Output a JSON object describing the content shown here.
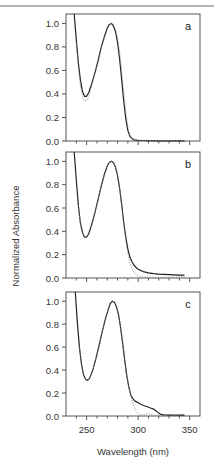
{
  "chart_data": {
    "type": "line",
    "layout": "3 vertically stacked panels sharing x-axis",
    "xlabel": "Wavelength (nm)",
    "ylabel": "Normalized Absorbance",
    "xlim": [
      230,
      360
    ],
    "ylim": [
      0.0,
      1.08
    ],
    "x_ticks": [
      250,
      300,
      350
    ],
    "x_minor_step": 10,
    "y_ticks": [
      0.0,
      0.2,
      0.4,
      0.6,
      0.8,
      1.0
    ],
    "y_tick_labels": [
      "0.0",
      "0.2",
      "0.4",
      "0.6",
      "0.8",
      "1.0"
    ],
    "grid": false,
    "legend": null,
    "panels": [
      {
        "label": "a",
        "series": [
          {
            "name": "solid",
            "style": "solid",
            "x": [
              238,
              240,
              242,
              244,
              246,
              248,
              250,
              252,
              255,
              258,
              261,
              264,
              267,
              270,
              272,
              274,
              276,
              278,
              280,
              282,
              284,
              286,
              288,
              290,
              292,
              294,
              296,
              298,
              300,
              305,
              310,
              320,
              330,
              340,
              345
            ],
            "y": [
              1.08,
              0.86,
              0.66,
              0.52,
              0.42,
              0.38,
              0.38,
              0.41,
              0.49,
              0.58,
              0.68,
              0.79,
              0.88,
              0.96,
              0.99,
              1.0,
              0.98,
              0.93,
              0.84,
              0.7,
              0.52,
              0.34,
              0.19,
              0.09,
              0.04,
              0.02,
              0.01,
              0.008,
              0.005,
              0.004,
              0.003,
              0.002,
              0.002,
              0.002,
              0.002
            ]
          },
          {
            "name": "dotted",
            "style": "dotted",
            "x": [
              240,
              242,
              244,
              246,
              248,
              250,
              252,
              255,
              258,
              261,
              264,
              267,
              270,
              272,
              274,
              276,
              278,
              280,
              282,
              284,
              286,
              288,
              290,
              292,
              294,
              296,
              298,
              300,
              305,
              310,
              320,
              330,
              340,
              345
            ],
            "y": [
              0.84,
              0.62,
              0.47,
              0.38,
              0.34,
              0.34,
              0.38,
              0.47,
              0.57,
              0.67,
              0.78,
              0.87,
              0.95,
              0.99,
              1.0,
              0.99,
              0.95,
              0.88,
              0.76,
              0.6,
              0.42,
              0.25,
              0.12,
              0.05,
              0.02,
              0.01,
              0.008,
              0.006,
              0.005,
              0.004,
              0.004,
              0.004,
              0.004,
              0.004
            ]
          }
        ]
      },
      {
        "label": "b",
        "series": [
          {
            "name": "solid",
            "style": "solid",
            "x": [
              238,
              240,
              242,
              244,
              246,
              248,
              250,
              252,
              255,
              258,
              261,
              264,
              267,
              270,
              272,
              274,
              276,
              278,
              280,
              282,
              284,
              286,
              288,
              290,
              292,
              294,
              296,
              298,
              300,
              305,
              310,
              315,
              320,
              330,
              340,
              345
            ],
            "y": [
              1.08,
              0.84,
              0.62,
              0.47,
              0.39,
              0.35,
              0.35,
              0.38,
              0.46,
              0.56,
              0.67,
              0.78,
              0.88,
              0.96,
              0.99,
              1.0,
              0.99,
              0.95,
              0.88,
              0.77,
              0.63,
              0.48,
              0.35,
              0.25,
              0.18,
              0.14,
              0.11,
              0.09,
              0.075,
              0.055,
              0.045,
              0.038,
              0.033,
              0.028,
              0.025,
              0.024
            ]
          },
          {
            "name": "dotted",
            "style": "dotted",
            "x": [
              242,
              244,
              246,
              248,
              250,
              252,
              255,
              258,
              261,
              264,
              267,
              270,
              272,
              274,
              276,
              278,
              280,
              282,
              284,
              286,
              288,
              290,
              292,
              294,
              296,
              298,
              300,
              302,
              305,
              310,
              320,
              330,
              340,
              345
            ],
            "y": [
              0.62,
              0.47,
              0.39,
              0.35,
              0.35,
              0.38,
              0.46,
              0.56,
              0.67,
              0.78,
              0.88,
              0.96,
              0.99,
              1.0,
              0.99,
              0.95,
              0.88,
              0.77,
              0.62,
              0.46,
              0.32,
              0.21,
              0.13,
              0.08,
              0.05,
              0.03,
              0.02,
              0.012,
              0.008,
              0.006,
              0.005,
              0.006,
              0.01,
              0.012
            ]
          }
        ]
      },
      {
        "label": "c",
        "series": [
          {
            "name": "solid",
            "style": "solid",
            "x": [
              239,
              241,
              243,
              245,
              247,
              249,
              251,
              253,
              256,
              259,
              262,
              265,
              268,
              271,
              273,
              275,
              277,
              279,
              281,
              283,
              285,
              287,
              289,
              291,
              293,
              295,
              297,
              300,
              303,
              306,
              309,
              312,
              315,
              318,
              320,
              322,
              325,
              330,
              335,
              340,
              345
            ],
            "y": [
              1.08,
              0.82,
              0.6,
              0.45,
              0.36,
              0.32,
              0.31,
              0.33,
              0.4,
              0.5,
              0.61,
              0.73,
              0.84,
              0.93,
              0.98,
              1.0,
              0.99,
              0.95,
              0.88,
              0.77,
              0.63,
              0.48,
              0.35,
              0.25,
              0.18,
              0.15,
              0.13,
              0.115,
              0.1,
              0.09,
              0.08,
              0.07,
              0.06,
              0.04,
              0.025,
              0.015,
              0.01,
              0.008,
              0.007,
              0.007,
              0.008
            ]
          },
          {
            "name": "dotted",
            "style": "dotted",
            "x": [
              243,
              245,
              247,
              249,
              251,
              253,
              256,
              259,
              262,
              265,
              268,
              271,
              273,
              275,
              277,
              279,
              281,
              283,
              285,
              287,
              289,
              291,
              293,
              295,
              297,
              299,
              301,
              305,
              310,
              315,
              320,
              325,
              330,
              335,
              340,
              345
            ],
            "y": [
              0.6,
              0.45,
              0.36,
              0.32,
              0.31,
              0.33,
              0.4,
              0.5,
              0.61,
              0.73,
              0.84,
              0.93,
              0.98,
              1.0,
              0.99,
              0.95,
              0.88,
              0.77,
              0.63,
              0.48,
              0.35,
              0.25,
              0.17,
              0.11,
              0.06,
              0.03,
              0.015,
              0.01,
              0.02,
              0.005,
              0.01,
              0.005,
              0.012,
              0.006,
              0.01,
              0.02
            ]
          }
        ]
      }
    ]
  },
  "layout_px": {
    "plot_left": 66,
    "plot_right": 200,
    "panels": [
      {
        "frame_top": 14,
        "y_zero": 141
      },
      {
        "frame_top": 152,
        "y_zero": 278
      },
      {
        "frame_top": 292,
        "y_zero": 416
      }
    ]
  }
}
